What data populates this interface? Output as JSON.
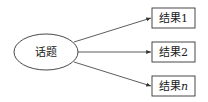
{
  "diagram": {
    "topic": {
      "label": "话题"
    },
    "results": [
      {
        "label": "结果",
        "suffix": "1",
        "italic": false
      },
      {
        "label": "结果",
        "suffix": "2",
        "italic": false
      },
      {
        "label": "结果",
        "suffix": "n",
        "italic": true
      }
    ],
    "colors": {
      "stroke": "#333333",
      "text": "#222222",
      "background": "#ffffff"
    }
  }
}
